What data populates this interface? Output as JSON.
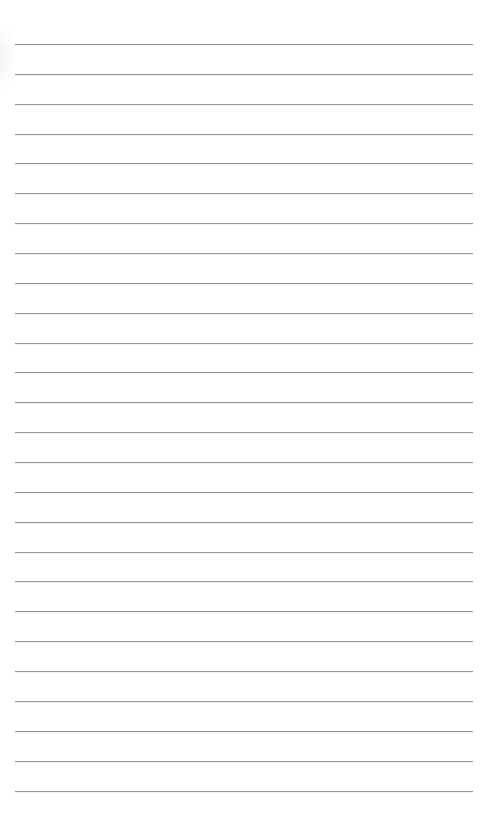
{
  "page": {
    "type": "lined-paper",
    "background_color": "#ffffff",
    "line_color": "#969696",
    "line_count": 26,
    "first_line_y": 44,
    "line_spacing": 29.86,
    "line_left": 15,
    "line_width": 458,
    "text_content": ""
  }
}
